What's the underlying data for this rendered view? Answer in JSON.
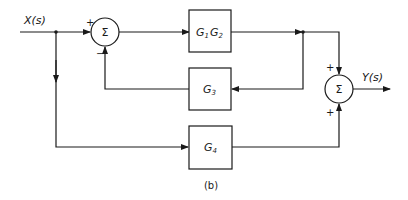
{
  "diagram": {
    "type": "block-diagram",
    "caption": "(b)",
    "input_label": "X(s)",
    "output_label": "Y(s)",
    "blocks": [
      {
        "id": "g1g2",
        "label_main": "G",
        "sub1": "1",
        "label_main2": "G",
        "sub2": "2"
      },
      {
        "id": "g3",
        "label_main": "G",
        "sub": "3"
      },
      {
        "id": "g4",
        "label_main": "G",
        "sub": "4"
      }
    ],
    "summing_junctions": [
      {
        "id": "sum1",
        "symbol": "Σ",
        "signs": {
          "top_left": "+",
          "bottom_left": "−"
        }
      },
      {
        "id": "sum2",
        "symbol": "Σ",
        "signs": {
          "top": "+",
          "bottom": "+"
        }
      }
    ],
    "connections": [
      "X(s) → sum1 (+)",
      "sum1 → G1G2",
      "G1G2 → G3 (feedback) → sum1 (−)",
      "G1G2 → sum2 (+)",
      "X(s) → G4 → sum2 (+)",
      "sum2 → Y(s)"
    ]
  }
}
